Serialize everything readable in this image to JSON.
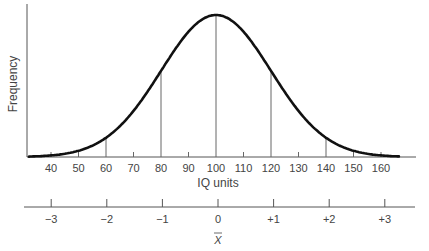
{
  "chart_data": {
    "type": "line",
    "title": "",
    "subtitle": "",
    "xlabel": "IQ units",
    "ylabel": "Frequency",
    "grid": false,
    "legend": null,
    "x_ticks": [
      40,
      50,
      60,
      70,
      80,
      90,
      100,
      110,
      120,
      130,
      140,
      150,
      160
    ],
    "xlim": [
      30,
      170
    ],
    "mean": 100,
    "sd": 20,
    "vertical_lines_at": [
      60,
      80,
      100,
      120,
      140
    ],
    "series": [
      {
        "name": "Normal distribution",
        "x": [
          30,
          40,
          50,
          60,
          70,
          80,
          90,
          100,
          110,
          120,
          130,
          140,
          150,
          160,
          170
        ],
        "values": [
          0.022,
          0.011,
          0.044,
          0.135,
          0.325,
          0.607,
          0.882,
          1.0,
          0.882,
          0.607,
          0.325,
          0.135,
          0.044,
          0.011,
          0.002
        ]
      }
    ],
    "secondary_axis": {
      "ticks": [
        "−3",
        "−2",
        "−1",
        "0",
        "+1",
        "+2",
        "+3"
      ],
      "values": [
        -3,
        -2,
        -1,
        0,
        1,
        2,
        3
      ],
      "label": "X̄"
    }
  },
  "labels": {
    "y_axis": "Frequency",
    "x_axis": "IQ units",
    "sigma_axis_label": "X"
  }
}
